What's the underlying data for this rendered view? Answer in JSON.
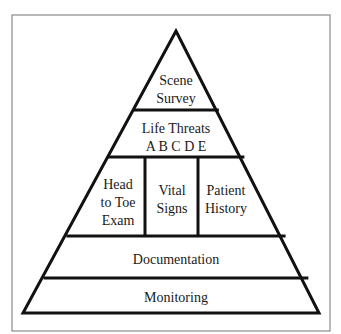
{
  "diagram": {
    "tiers": [
      {
        "id": "scene-survey",
        "lines": [
          "Scene",
          "Survey"
        ]
      },
      {
        "id": "life-threats",
        "lines": [
          "Life Threats",
          "A B C D E"
        ]
      },
      {
        "id": "secondary",
        "cells": [
          {
            "id": "head-to-toe-exam",
            "lines": [
              "Head",
              "to Toe",
              "Exam"
            ]
          },
          {
            "id": "vital-signs",
            "lines": [
              "Vital",
              "Signs"
            ]
          },
          {
            "id": "patient-history",
            "lines": [
              "Patient",
              "History"
            ]
          }
        ]
      },
      {
        "id": "documentation",
        "lines": [
          "Documentation"
        ]
      },
      {
        "id": "monitoring",
        "lines": [
          "Monitoring"
        ]
      }
    ],
    "colors": {
      "line": "#111111",
      "frame": "#8a8a8a",
      "text": "#1a1a1a",
      "background": "#ffffff"
    }
  }
}
